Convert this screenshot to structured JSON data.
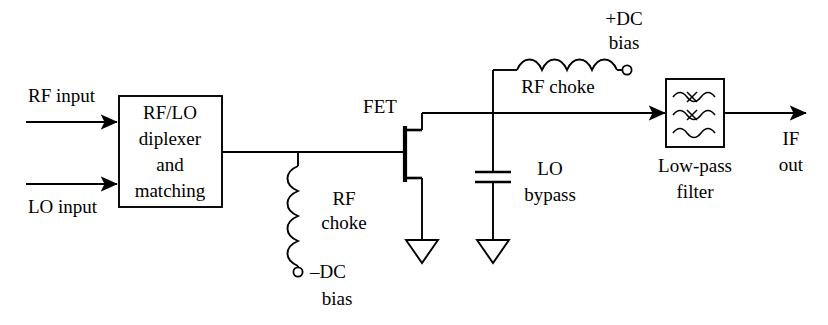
{
  "diagram": {
    "background_color": "#ffffff",
    "line_color": "#000000",
    "labels": {
      "rf_input": "RF input",
      "lo_input": "LO input",
      "diplexer_line1": "RF/LO",
      "diplexer_line2": "diplexer",
      "diplexer_line3": "and",
      "diplexer_line4": "matching",
      "gate_choke_line1": "RF",
      "gate_choke_line2": "choke",
      "neg_bias_line1": "–DC",
      "neg_bias_line2": "bias",
      "fet": "FET",
      "drain_choke": "RF choke",
      "pos_bias_line1": "+DC",
      "pos_bias_line2": "bias",
      "bypass_line1": "LO",
      "bypass_line2": "bypass",
      "filter_line1": "Low-pass",
      "filter_line2": "filter",
      "if_out_line1": "IF",
      "if_out_line2": "out"
    },
    "components": [
      {
        "name": "rf-lo-diplexer-block",
        "type": "block"
      },
      {
        "name": "gate-rf-choke",
        "type": "inductor"
      },
      {
        "name": "negative-dc-bias-terminal",
        "type": "terminal"
      },
      {
        "name": "fet-transistor",
        "type": "mesfet"
      },
      {
        "name": "source-ground",
        "type": "ground"
      },
      {
        "name": "lo-bypass-capacitor",
        "type": "capacitor"
      },
      {
        "name": "bypass-ground",
        "type": "ground"
      },
      {
        "name": "drain-rf-choke",
        "type": "inductor"
      },
      {
        "name": "positive-dc-bias-terminal",
        "type": "terminal"
      },
      {
        "name": "low-pass-filter-block",
        "type": "block"
      }
    ]
  }
}
